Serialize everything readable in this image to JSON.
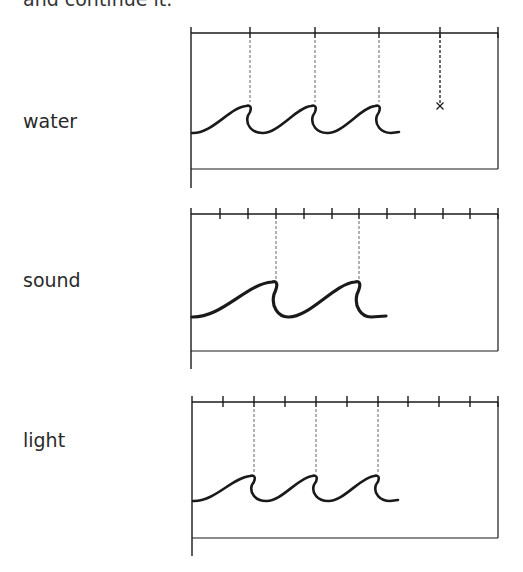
{
  "instruction": {
    "text": "and continue it."
  },
  "panels": [
    {
      "id": "water",
      "label": "water",
      "label_baseline_y": 133,
      "frame": {
        "left": 191,
        "right": 498,
        "top": 33,
        "bottom": 169,
        "left_extend_to": 188
      },
      "tick_spacing": 64,
      "ticks_x": [
        250,
        315,
        379,
        440
      ],
      "dashed_x": [
        250,
        315,
        379
      ],
      "dashed_to_y": 102,
      "continuation_marker": {
        "x": 440,
        "y": 106,
        "symbol": "×"
      },
      "wave": {
        "baseline_y": 133,
        "crest_y": 106,
        "start_x": 192,
        "crests_x": [
          250,
          315,
          379
        ],
        "end_x": 399,
        "stroke_width": 2.6
      }
    },
    {
      "id": "sound",
      "label": "sound",
      "label_baseline_y": 292,
      "frame": {
        "left": 191,
        "right": 498,
        "top": 214,
        "bottom": 351,
        "left_extend_to": 351
      },
      "tick_spacing": 27.8,
      "ticks_x": [
        220,
        248,
        276,
        304,
        332,
        359,
        387,
        415,
        443,
        470
      ],
      "dashed_x": [
        276,
        359
      ],
      "dashed_to_y": 280,
      "wave": {
        "baseline_y": 317,
        "crest_y": 282,
        "start_x": 192,
        "crests_x": [
          276,
          359
        ],
        "end_x": 386,
        "stroke_width": 3.2
      }
    },
    {
      "id": "light",
      "label": "light",
      "label_baseline_y": 452,
      "frame": {
        "left": 192,
        "right": 498,
        "top": 402,
        "bottom": 538,
        "left_extend_to": 556
      },
      "tick_spacing": 30.9,
      "ticks_x": [
        223,
        254,
        285,
        316,
        347,
        378,
        408,
        439,
        470
      ],
      "dashed_x": [
        254,
        316,
        378
      ],
      "dashed_to_y": 472,
      "wave": {
        "baseline_y": 501,
        "crest_y": 476,
        "start_x": 193,
        "crests_x": [
          254,
          316,
          378
        ],
        "end_x": 398,
        "stroke_width": 2.6
      }
    }
  ],
  "colors": {
    "line": "#1a1a1a",
    "dashed": "#555555",
    "text": "#2a2a2a"
  }
}
